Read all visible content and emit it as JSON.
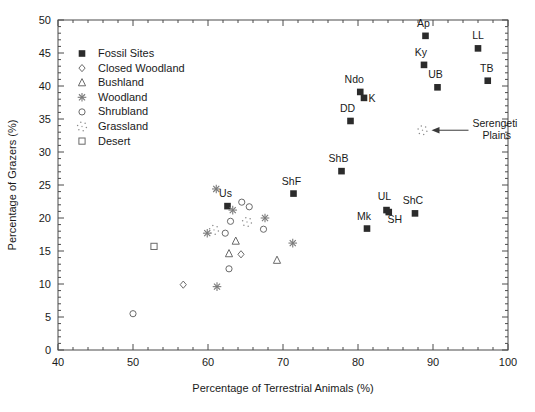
{
  "chart_data": {
    "type": "scatter",
    "title": "",
    "xlabel": "Percentage of Terrestrial Animals (%)",
    "ylabel": "Percentage of Grazers (%)",
    "xlim": [
      40,
      100
    ],
    "ylim": [
      0,
      50
    ],
    "xticks": [
      40,
      50,
      60,
      70,
      80,
      90,
      100
    ],
    "yticks": [
      0,
      5,
      10,
      15,
      20,
      25,
      30,
      35,
      40,
      45,
      50
    ],
    "grid": false,
    "legend_position": "upper-left-inside",
    "legend": [
      {
        "label": "Fossil Sites",
        "marker": "filled-square"
      },
      {
        "label": "Closed Woodland",
        "marker": "open-diamond"
      },
      {
        "label": "Bushland",
        "marker": "open-triangle"
      },
      {
        "label": "Woodland",
        "marker": "asterisk-star"
      },
      {
        "label": "Shrubland",
        "marker": "open-circle"
      },
      {
        "label": "Grassland",
        "marker": "dotted-star"
      },
      {
        "label": "Desert",
        "marker": "open-square"
      }
    ],
    "annotations": [
      {
        "text": "Serengeti Plains",
        "line1": "Serengeti",
        "line2": "Plains",
        "points_to_x": 88.6,
        "points_to_y": 33.3,
        "arrow": "left"
      }
    ],
    "series": [
      {
        "name": "Fossil Sites",
        "marker": "filled-square",
        "points": [
          {
            "label": "Ap",
            "x": 89.0,
            "y": 47.6,
            "lx": -2,
            "ly": -9
          },
          {
            "label": "LL",
            "x": 96.0,
            "y": 45.7,
            "lx": 0,
            "ly": -9
          },
          {
            "label": "Ky",
            "x": 88.8,
            "y": 43.2,
            "lx": -3,
            "ly": -9
          },
          {
            "label": "TB",
            "x": 97.3,
            "y": 40.8,
            "lx": -1,
            "ly": -9
          },
          {
            "label": "UB",
            "x": 90.6,
            "y": 39.8,
            "lx": -2,
            "ly": -9
          },
          {
            "label": "Ndo",
            "x": 80.3,
            "y": 39.1,
            "lx": -6,
            "ly": -9
          },
          {
            "label": "K",
            "x": 80.8,
            "y": 38.2,
            "lx": 8,
            "ly": 4
          },
          {
            "label": "DD",
            "x": 79.0,
            "y": 34.7,
            "lx": -3,
            "ly": -9
          },
          {
            "label": "ShB",
            "x": 77.8,
            "y": 27.1,
            "lx": -3,
            "ly": -9
          },
          {
            "label": "ShF",
            "x": 71.4,
            "y": 23.7,
            "lx": -2,
            "ly": -9
          },
          {
            "label": "Us",
            "x": 62.6,
            "y": 21.8,
            "lx": -2,
            "ly": -9
          },
          {
            "label": "UL",
            "x": 83.8,
            "y": 21.2,
            "lx": -2,
            "ly": -10
          },
          {
            "label": "ShC",
            "x": 87.6,
            "y": 20.7,
            "lx": -2,
            "ly": -9
          },
          {
            "label": "SH",
            "x": 84.1,
            "y": 20.9,
            "lx": 6,
            "ly": 11
          },
          {
            "label": "Mk",
            "x": 81.2,
            "y": 18.4,
            "lx": -3,
            "ly": -9
          }
        ]
      },
      {
        "name": "Closed Woodland",
        "marker": "open-diamond",
        "points": [
          {
            "x": 64.4,
            "y": 14.5
          },
          {
            "x": 56.7,
            "y": 9.9
          }
        ]
      },
      {
        "name": "Bushland",
        "marker": "open-triangle",
        "points": [
          {
            "x": 63.7,
            "y": 16.5
          },
          {
            "x": 62.8,
            "y": 14.6
          },
          {
            "x": 69.2,
            "y": 13.6
          }
        ]
      },
      {
        "name": "Woodland",
        "marker": "asterisk-star",
        "points": [
          {
            "x": 61.1,
            "y": 24.4
          },
          {
            "x": 63.3,
            "y": 21.2
          },
          {
            "x": 67.6,
            "y": 20.0
          },
          {
            "x": 59.9,
            "y": 17.7
          },
          {
            "x": 71.3,
            "y": 16.2
          },
          {
            "x": 61.2,
            "y": 9.6
          }
        ]
      },
      {
        "name": "Shrubland",
        "marker": "open-circle",
        "points": [
          {
            "x": 64.5,
            "y": 22.4
          },
          {
            "x": 65.5,
            "y": 21.7
          },
          {
            "x": 63.0,
            "y": 19.5
          },
          {
            "x": 67.4,
            "y": 18.3
          },
          {
            "x": 62.3,
            "y": 17.7
          },
          {
            "x": 62.8,
            "y": 12.3
          },
          {
            "x": 50.0,
            "y": 5.5
          }
        ]
      },
      {
        "name": "Grassland",
        "marker": "dotted-star",
        "points": [
          {
            "x": 88.6,
            "y": 33.3
          },
          {
            "x": 65.2,
            "y": 19.4
          },
          {
            "x": 60.8,
            "y": 18.2
          }
        ]
      },
      {
        "name": "Desert",
        "marker": "open-square",
        "points": [
          {
            "x": 52.8,
            "y": 15.7
          }
        ]
      }
    ]
  }
}
